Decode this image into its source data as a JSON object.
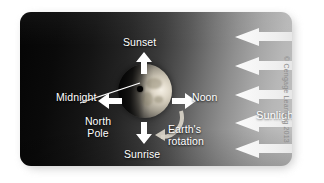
{
  "figure": {
    "credit": "© Cengage Learning 2013"
  },
  "labels": {
    "sunset": "Sunset",
    "midnight": "Midnight",
    "noon": "Noon",
    "sunrise": "Sunrise",
    "north_pole": "North Pole",
    "earths_rotation": "Earth's rotation",
    "sunlight": "Sunlight"
  },
  "icons": {
    "arrow_up": "arrow-up-icon",
    "arrow_down": "arrow-down-icon",
    "arrow_left": "arrow-left-icon",
    "arrow_right": "arrow-right-icon",
    "rotation_arrow": "curved-rotation-arrow-icon",
    "leader_line": "leader-line-icon",
    "globe": "earth-globe-icon",
    "pole_dot": "north-pole-point-icon",
    "sunbeam": "sunlight-beam-arrow-icon"
  },
  "colors": {
    "panel_dark": "#050505",
    "panel_light": "#c2c2c2",
    "label_text": "#ffffff",
    "credit_text": "#8d8d8d",
    "arrow_fill": "#ffffff",
    "beam_fill": "#e8e8e8",
    "pole_dot": "#000000"
  },
  "sunbeams": [
    {
      "top": 28
    },
    {
      "top": 57
    },
    {
      "top": 86
    },
    {
      "top": 114
    },
    {
      "top": 140
    }
  ]
}
